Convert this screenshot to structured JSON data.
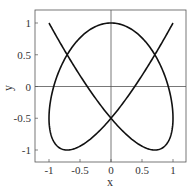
{
  "chart_data": {
    "type": "line",
    "title": "",
    "xlabel": "x",
    "ylabel": "y",
    "xlim": [
      -1.2,
      1.2
    ],
    "ylim": [
      -1.2,
      1.2
    ],
    "x_ticks": [
      -1,
      -0.5,
      0,
      0.5,
      1
    ],
    "x_tick_labels": [
      "-1",
      "-0.5",
      "0",
      "0.5",
      "1"
    ],
    "y_ticks": [
      -1,
      -0.5,
      0,
      0.5,
      1
    ],
    "y_tick_labels": [
      "-1",
      "-0.5",
      "0",
      "0.5",
      "1"
    ],
    "grid": false,
    "zero_lines": true,
    "legend": null,
    "series": [
      {
        "name": "Lissajous curve",
        "parametric": "x = sin(3t), y = cos(4t), t in [0, 2pi]",
        "color": "#111111",
        "notable_points": {
          "y_zero_crossings_x": [
            -0.82,
            -0.32,
            0.32,
            0.82
          ],
          "x_zero_crossings_y": [
            -0.5,
            0.5
          ],
          "top_tangencies_x": [
            -0.97,
            0,
            0.97
          ],
          "bottom_tangencies_x": [
            -0.97,
            0,
            0.97
          ]
        }
      }
    ]
  }
}
